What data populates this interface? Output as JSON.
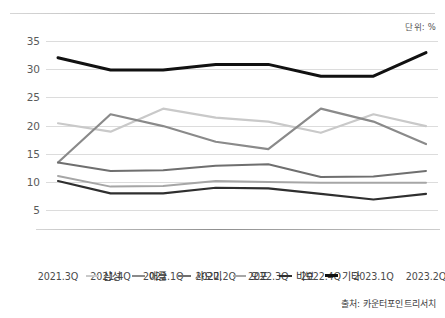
{
  "unit_note": "단위: %",
  "source_note": "출처: 카운터포인트리서치",
  "chart_data": {
    "type": "line",
    "title": "",
    "xlabel": "",
    "ylabel": "",
    "unit": "%",
    "ylim": [
      3.5,
      36.5
    ],
    "yticks": [
      5,
      10,
      15,
      20,
      25,
      30,
      35
    ],
    "grid": true,
    "legend_position": "bottom",
    "categories": [
      "2021.3Q",
      "2021.4Q",
      "2022.1Q",
      "2022.2Q",
      "2022.3Q",
      "2022.4Q",
      "2023.1Q",
      "2023.2Q"
    ],
    "series": [
      {
        "name": "삼성",
        "color": "#c9c9c9",
        "width": 2.2,
        "values": [
          20.4,
          18.9,
          23.0,
          21.4,
          20.7,
          18.7,
          22.0,
          19.9
        ]
      },
      {
        "name": "애플",
        "color": "#8a8a8a",
        "width": 2.2,
        "values": [
          13.4,
          22.0,
          19.9,
          17.1,
          15.8,
          23.0,
          20.7,
          16.7
        ]
      },
      {
        "name": "샤오미",
        "color": "#6f6f6f",
        "width": 2.0,
        "values": [
          13.4,
          11.9,
          12.0,
          12.8,
          13.1,
          10.8,
          10.9,
          11.9
        ]
      },
      {
        "name": "오포",
        "color": "#a6a6a6",
        "width": 2.0,
        "values": [
          11.0,
          9.1,
          9.2,
          10.1,
          9.9,
          9.8,
          9.8,
          9.8
        ]
      },
      {
        "name": "비보",
        "color": "#2f2f2f",
        "width": 2.2,
        "values": [
          10.1,
          7.9,
          7.9,
          8.9,
          8.8,
          7.8,
          6.8,
          7.8
        ]
      },
      {
        "name": "기타",
        "color": "#111111",
        "width": 3.0,
        "values": [
          32.1,
          29.9,
          29.9,
          30.9,
          30.9,
          28.8,
          28.8,
          33.0
        ]
      }
    ]
  }
}
